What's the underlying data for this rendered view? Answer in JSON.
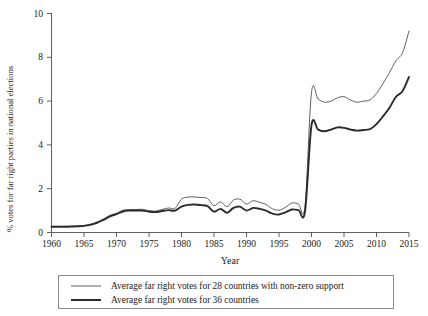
{
  "chart_data": {
    "type": "line",
    "title": "",
    "xlabel": "Year",
    "ylabel": "% votes for far right parties in national elections",
    "xlim": [
      1960,
      2015
    ],
    "ylim": [
      0,
      10
    ],
    "xticks": [
      1960,
      1965,
      1970,
      1975,
      1980,
      1985,
      1990,
      1995,
      2000,
      2005,
      2010,
      2015
    ],
    "yticks": [
      0,
      2,
      4,
      6,
      8,
      10
    ],
    "grid": false,
    "legend_position": "bottom",
    "x": [
      1960,
      1961,
      1962,
      1963,
      1964,
      1965,
      1966,
      1967,
      1968,
      1969,
      1970,
      1971,
      1972,
      1973,
      1974,
      1975,
      1976,
      1977,
      1978,
      1979,
      1980,
      1981,
      1982,
      1983,
      1984,
      1985,
      1986,
      1987,
      1988,
      1989,
      1990,
      1991,
      1992,
      1993,
      1994,
      1995,
      1996,
      1997,
      1998,
      1999,
      2000,
      2001,
      2002,
      2003,
      2004,
      2005,
      2006,
      2007,
      2008,
      2009,
      2010,
      2011,
      2012,
      2013,
      2014,
      2015
    ],
    "series": [
      {
        "name": "Average far right votes for 28 countries with non-zero support",
        "style": "thin",
        "color": "#5f5f5f",
        "values": [
          0.28,
          0.28,
          0.28,
          0.29,
          0.3,
          0.32,
          0.38,
          0.48,
          0.62,
          0.78,
          0.88,
          1.02,
          1.05,
          1.05,
          1.06,
          1.0,
          0.98,
          1.05,
          1.12,
          1.1,
          1.52,
          1.62,
          1.62,
          1.6,
          1.55,
          1.22,
          1.4,
          1.18,
          1.48,
          1.52,
          1.3,
          1.45,
          1.38,
          1.28,
          1.08,
          1.02,
          1.15,
          1.35,
          1.3,
          1.2,
          1.28,
          1.72,
          2.52,
          4.2,
          6.25,
          7.05,
          6.85,
          7.2,
          7.55,
          7.55,
          7.3,
          7.02,
          7.1,
          7.1,
          6.82,
          6.3
        ]
      },
      {
        "name": "Average far right votes for 36 countries",
        "style": "thick",
        "color": "#2b2b2b",
        "values": [
          0.26,
          0.26,
          0.26,
          0.27,
          0.28,
          0.3,
          0.35,
          0.44,
          0.58,
          0.74,
          0.84,
          0.96,
          1.0,
          1.0,
          1.0,
          0.95,
          0.93,
          0.98,
          1.02,
          1.0,
          1.18,
          1.26,
          1.28,
          1.25,
          1.2,
          0.95,
          1.08,
          0.9,
          1.12,
          1.18,
          1.0,
          1.12,
          1.08,
          1.0,
          0.86,
          0.82,
          0.92,
          1.05,
          1.02,
          0.95,
          1.0,
          1.35,
          1.95,
          3.25,
          4.85,
          5.45,
          5.3,
          5.55,
          5.8,
          5.78,
          5.6,
          5.4,
          5.45,
          5.45,
          5.25,
          4.85
        ]
      }
    ],
    "series_full": {
      "note": "Values continue to 2015 — see xfull/series_full_values",
      "xfull": [
        2000,
        2001,
        2002,
        2003,
        2004,
        2005,
        2006,
        2007,
        2008,
        2009,
        2010,
        2011,
        2012,
        2013,
        2014,
        2015
      ],
      "thin_tail": [
        6.4,
        6.1,
        5.95,
        6.0,
        6.15,
        6.2,
        6.05,
        5.95,
        6.0,
        6.05,
        6.35,
        6.8,
        7.3,
        7.85,
        8.2,
        9.2
      ],
      "thick_tail": [
        4.9,
        4.7,
        4.62,
        4.7,
        4.8,
        4.78,
        4.7,
        4.65,
        4.68,
        4.72,
        4.95,
        5.3,
        5.7,
        6.2,
        6.45,
        7.1
      ]
    }
  },
  "axis": {
    "xlabel": "Year",
    "ylabel": "% votes for far right parties in national elections",
    "xticks": [
      "1960",
      "1965",
      "1970",
      "1975",
      "1980",
      "1985",
      "1990",
      "1995",
      "2000",
      "2005",
      "2010",
      "2015"
    ],
    "yticks": [
      "0",
      "2",
      "4",
      "6",
      "8",
      "10"
    ]
  },
  "legend": {
    "items": [
      {
        "label": "Average far right votes for 28 countries with non-zero support",
        "style": "thin"
      },
      {
        "label": "Average far right votes for 36 countries",
        "style": "thick"
      }
    ]
  }
}
